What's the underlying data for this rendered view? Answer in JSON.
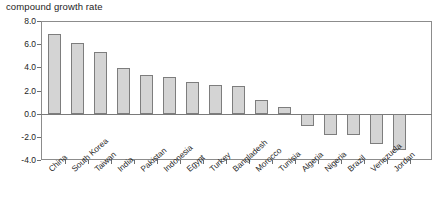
{
  "chart_data": {
    "type": "bar",
    "title": "compound growth rate",
    "xlabel": "",
    "ylabel": "",
    "ylim": [
      -4.0,
      8.0
    ],
    "yticks": [
      "8.0",
      "6.0",
      "4.0",
      "2.0",
      "0.0",
      "-2.0",
      "-4.0"
    ],
    "ytick_values": [
      8.0,
      6.0,
      4.0,
      2.0,
      0.0,
      -2.0,
      -4.0
    ],
    "grid": false,
    "legend": "none",
    "categories": [
      "China",
      "South Korea",
      "Taiwan",
      "India",
      "Pakistan",
      "Indonesia",
      "Egypt",
      "Turkey",
      "Bangladesh",
      "Morocco",
      "Tunisia",
      "Algeria",
      "Nigeria",
      "Brazil",
      "Venezuela",
      "Jordan"
    ],
    "values": [
      6.9,
      6.1,
      5.3,
      3.9,
      3.35,
      3.2,
      2.75,
      2.45,
      2.4,
      1.2,
      0.6,
      -1.1,
      -1.8,
      -1.8,
      -2.6,
      -3.1
    ],
    "bar_color": "#d4d4d4",
    "bar_edge_color": "#7d7d7d"
  }
}
